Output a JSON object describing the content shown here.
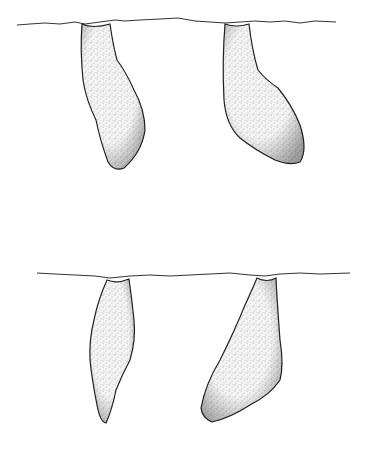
{
  "figure": {
    "background": "#ffffff",
    "ink": "#222222",
    "panels": [
      {
        "id": "top",
        "ground_y": 24,
        "burrows": [
          "top-left",
          "top-right"
        ]
      },
      {
        "id": "bottom",
        "ground_y": 274,
        "burrows": [
          "bottom-left",
          "bottom-right"
        ]
      }
    ]
  }
}
